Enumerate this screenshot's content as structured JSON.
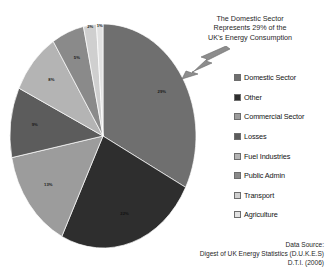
{
  "chart_data": {
    "type": "pie",
    "title": "",
    "categories": [
      "Domestic Sector",
      "Other",
      "Commercial Sector",
      "Losses",
      "Fuel Industries",
      "Public Admin",
      "Transport",
      "Agriculture"
    ],
    "values": [
      29,
      22,
      13,
      9,
      8,
      5,
      2,
      1
    ],
    "value_labels": [
      "29%",
      "22%",
      "13%",
      "9%",
      "8%",
      "5%",
      "2%",
      "1%"
    ],
    "colors": [
      "#6f6f6f",
      "#2e2e2e",
      "#9c9c9c",
      "#5c5c5c",
      "#b4b4b4",
      "#8a8a8a",
      "#cfcfcf",
      "#e2e2e2"
    ],
    "legend_position": "right",
    "grid": false,
    "start_angle_deg": 0,
    "direction": "clockwise"
  },
  "annotation": {
    "line1": "The Domestic Sector",
    "line2": "Represents 29% of the",
    "line3": "UK's Energy Consumption",
    "pointer_label": "29%"
  },
  "legend": {
    "items": [
      {
        "label": "Domestic Sector",
        "color": "#6f6f6f"
      },
      {
        "label": "Other",
        "color": "#2e2e2e"
      },
      {
        "label": "Commercial Sector",
        "color": "#9c9c9c"
      },
      {
        "label": "Losses",
        "color": "#5c5c5c"
      },
      {
        "label": "Fuel Industries",
        "color": "#b4b4b4"
      },
      {
        "label": "Public Admin",
        "color": "#8a8a8a"
      },
      {
        "label": "Transport",
        "color": "#cfcfcf"
      },
      {
        "label": "Agriculture",
        "color": "#e2e2e2"
      }
    ]
  },
  "source": {
    "line1": "Data Source:",
    "line2": "Digest of UK Energy Statistics  (D.U.K.E.S)",
    "line3": "D.T.I. (2006)"
  }
}
